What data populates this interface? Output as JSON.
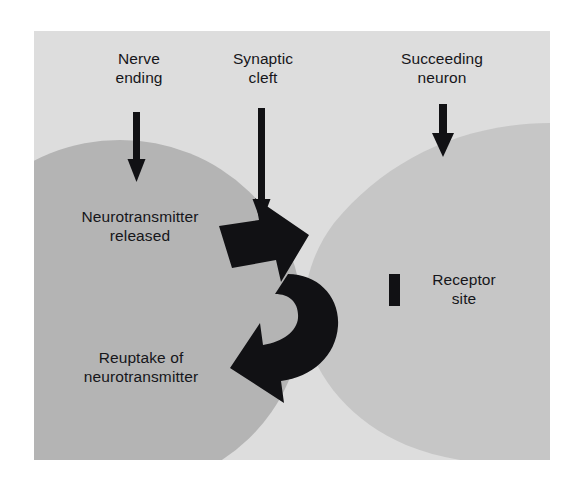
{
  "figure": {
    "kind": "synapse-neurotransmission-diagram",
    "background_color": "#dddddd",
    "page_background_color": "#ffffff",
    "ink_color": "#111114"
  },
  "labels": {
    "nerve_ending": "Nerve\nending",
    "synaptic_cleft": "Synaptic\ncleft",
    "succeeding_neuron": "Succeeding\nneuron",
    "neurotransmitter_released": "Neurotransmitter\nreleased",
    "reuptake": "Reuptake of\nneurotransmitter",
    "receptor_site": "Receptor\nsite"
  },
  "structures": {
    "presynaptic_neuron": {
      "name": "Nerve ending (presynaptic terminal)",
      "fill": "#b4b4b4"
    },
    "postsynaptic_neuron": {
      "name": "Succeeding neuron (postsynaptic)",
      "fill": "#c6c6c6"
    },
    "synaptic_cleft": {
      "name": "Synaptic cleft",
      "fill": "#dddddd"
    },
    "receptor_site_marker": {
      "name": "Receptor site",
      "fill": "#111114"
    }
  },
  "arrows": {
    "pointer_nerve_ending": "down-arrow",
    "pointer_synaptic_cleft": "down-arrow",
    "pointer_succeeding_neuron": "down-arrow",
    "release_flow": "thick-right-arrow",
    "reuptake_flow": "curved-left-return-arrow"
  }
}
